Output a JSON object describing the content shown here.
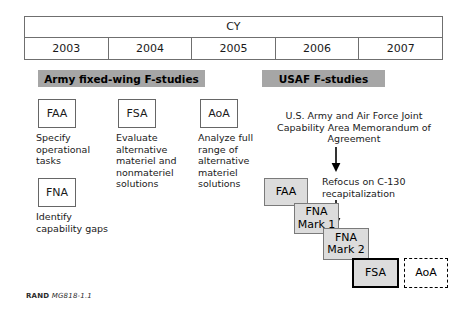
{
  "timeline": {
    "header_label": "CY",
    "years": [
      "2003",
      "2004",
      "2005",
      "2006",
      "2007"
    ]
  },
  "banners": {
    "army": "Army fixed-wing F-studies",
    "usaf": "USAF F-studies"
  },
  "army_studies": [
    {
      "code": "FAA",
      "caption": "Specify operational tasks"
    },
    {
      "code": "FSA",
      "caption": "Evaluate alternative materiel and nonmateriel solutions"
    },
    {
      "code": "FNA",
      "caption": "Identify capability gaps"
    }
  ],
  "aoa_study": {
    "code": "AoA",
    "caption": "Analyze full range of alternative materiel solutions"
  },
  "usaf_notes": {
    "moa": "U.S. Army and Air Force Joint Capability Area Memorandum of Agreement",
    "refocus": "Refocus on C-130 recapitalization"
  },
  "usaf_sequence": [
    {
      "code": "FAA",
      "style": "shaded"
    },
    {
      "code": "FNA Mark 1",
      "style": "shaded"
    },
    {
      "code": "FNA Mark 2",
      "style": "shaded"
    },
    {
      "code": "FSA",
      "style": "shaded-bold"
    },
    {
      "code": "AoA",
      "style": "dashed-planned"
    }
  ],
  "footer": {
    "org": "RAND",
    "document_id": "MG818-1.1"
  },
  "colors": {
    "banner_fill": "#a6a6a6",
    "box_fill": "#dcdcdc",
    "border": "#666666",
    "text": "#1a1a1a"
  }
}
